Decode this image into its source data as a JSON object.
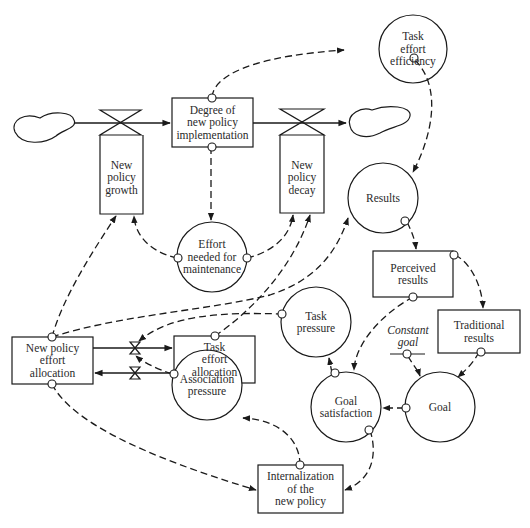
{
  "diagram": {
    "type": "stock-and-flow causal diagram",
    "stocks": [
      {
        "id": "degree",
        "label": "Degree of\nnew policy\nimplementation"
      },
      {
        "id": "perceived",
        "label": "Perceived\nresults"
      },
      {
        "id": "traditional",
        "label": "Traditional\nresults"
      },
      {
        "id": "npea",
        "label": "New policy\neffort\nallocation"
      },
      {
        "id": "tea",
        "label": "Task\neffort\nallocation"
      },
      {
        "id": "internalization",
        "label": "Internalization\nof the\nnew policy"
      }
    ],
    "flows": [
      {
        "id": "growth",
        "label": "New\npolicy\ngrowth"
      },
      {
        "id": "decay",
        "label": "New\npolicy\ndecay"
      }
    ],
    "auxiliaries": [
      {
        "id": "tee",
        "label": "Task\neffort\nefficiency"
      },
      {
        "id": "results",
        "label": "Results"
      },
      {
        "id": "effort_needed",
        "label": "Effort\nneeded for\nmaintenance"
      },
      {
        "id": "task_pressure",
        "label": "Task\npressure"
      },
      {
        "id": "goal",
        "label": "Goal"
      },
      {
        "id": "goal_satisfaction",
        "label": "Goal\nsatisfaction"
      },
      {
        "id": "association_pressure",
        "label": "Association\npressure"
      }
    ],
    "constants": [
      {
        "id": "constant_goal",
        "label": "Constant\ngoal"
      }
    ],
    "links": [
      {
        "from": "degree",
        "to": "tee"
      },
      {
        "from": "degree",
        "to": "effort_needed"
      },
      {
        "from": "tee",
        "to": "results"
      },
      {
        "from": "results",
        "to": "perceived"
      },
      {
        "from": "perceived",
        "to": "traditional"
      },
      {
        "from": "perceived",
        "to": "goal_satisfaction"
      },
      {
        "from": "traditional",
        "to": "goal"
      },
      {
        "from": "constant_goal",
        "to": "goal"
      },
      {
        "from": "goal",
        "to": "goal_satisfaction"
      },
      {
        "from": "goal_satisfaction",
        "to": "task_pressure"
      },
      {
        "from": "goal_satisfaction",
        "to": "internalization"
      },
      {
        "from": "internalization",
        "to": "association_pressure"
      },
      {
        "from": "association_pressure",
        "to": "reallocation_valve_lower"
      },
      {
        "from": "task_pressure",
        "to": "reallocation_valve_upper"
      },
      {
        "from": "effort_needed",
        "to": "growth"
      },
      {
        "from": "effort_needed",
        "to": "decay"
      },
      {
        "from": "npea",
        "to": "growth"
      },
      {
        "from": "npea",
        "to": "results"
      },
      {
        "from": "npea",
        "to": "internalization"
      },
      {
        "from": "tea",
        "to": "decay"
      }
    ]
  }
}
